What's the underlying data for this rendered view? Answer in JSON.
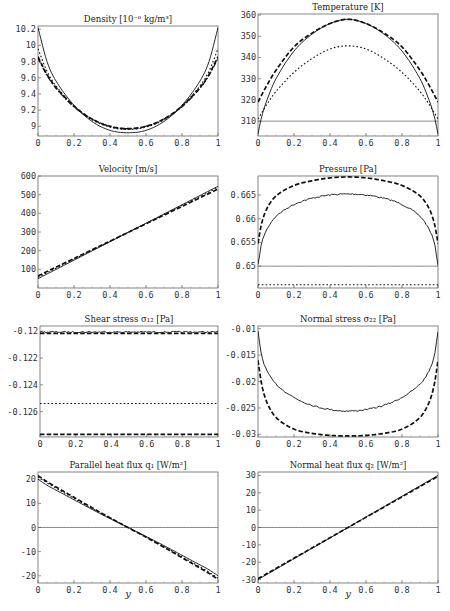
{
  "chart_data": [
    {
      "type": "line",
      "title": "Density [10⁻⁶ kg/m³]",
      "xlabel": "",
      "ylabel": "",
      "xlim": [
        0,
        1
      ],
      "ylim": [
        8.88,
        10.24
      ],
      "xticks": [
        "0",
        "0.2",
        "0.4",
        "0.6",
        "0.8",
        "1"
      ],
      "yticks": [
        {
          "v": 9,
          "label": "9"
        },
        {
          "v": 9.2,
          "label": "9.2"
        },
        {
          "v": 9.4,
          "label": "9.4"
        },
        {
          "v": 9.6,
          "label": "9.6"
        },
        {
          "v": 9.8,
          "label": "9.8"
        },
        {
          "v": 10,
          "label": "10"
        },
        {
          "v": 10.2,
          "label": "10.2"
        }
      ],
      "series": [
        {
          "name": "solid",
          "style": "solid",
          "x": [
            0,
            0.05,
            0.1,
            0.2,
            0.3,
            0.4,
            0.5,
            0.6,
            0.7,
            0.8,
            0.9,
            0.95,
            1
          ],
          "y": [
            10.22,
            9.8,
            9.56,
            9.26,
            9.06,
            8.95,
            8.92,
            8.95,
            9.06,
            9.26,
            9.56,
            9.8,
            10.22
          ]
        },
        {
          "name": "dotted",
          "style": "dotted",
          "x": [
            0,
            0.05,
            0.1,
            0.2,
            0.3,
            0.4,
            0.5,
            0.6,
            0.7,
            0.8,
            0.9,
            0.95,
            1
          ],
          "y": [
            9.96,
            9.68,
            9.5,
            9.25,
            9.08,
            8.99,
            8.96,
            8.99,
            9.08,
            9.25,
            9.5,
            9.68,
            9.96
          ]
        },
        {
          "name": "dashed",
          "style": "dashed",
          "x": [
            0,
            0.05,
            0.1,
            0.2,
            0.3,
            0.4,
            0.5,
            0.6,
            0.7,
            0.8,
            0.9,
            0.95,
            1
          ],
          "y": [
            9.86,
            9.64,
            9.48,
            9.25,
            9.09,
            9.0,
            8.97,
            9.0,
            9.09,
            9.25,
            9.48,
            9.64,
            9.86
          ]
        },
        {
          "name": "dash-dot",
          "style": "dashdot",
          "x": [
            0,
            0.05,
            0.1,
            0.2,
            0.3,
            0.4,
            0.5,
            0.6,
            0.7,
            0.8,
            0.9,
            0.95,
            1
          ],
          "y": [
            9.84,
            9.63,
            9.47,
            9.24,
            9.09,
            9.0,
            8.97,
            9.0,
            9.09,
            9.24,
            9.47,
            9.63,
            9.84
          ]
        }
      ]
    },
    {
      "type": "line",
      "title": "Temperature [K]",
      "xlabel": "",
      "ylabel": "",
      "xlim": [
        0,
        1
      ],
      "ylim": [
        303,
        360.5
      ],
      "xticks": [
        "0",
        "0.2",
        "0.4",
        "0.6",
        "0.8",
        "1"
      ],
      "yticks": [
        {
          "v": 310,
          "label": "310"
        },
        {
          "v": 320,
          "label": "320"
        },
        {
          "v": 330,
          "label": "330"
        },
        {
          "v": 340,
          "label": "340"
        },
        {
          "v": 350,
          "label": "350"
        },
        {
          "v": 360,
          "label": "360"
        }
      ],
      "series": [
        {
          "name": "wall-reference",
          "style": "thin",
          "x": [
            0,
            1
          ],
          "y": [
            310,
            310
          ]
        },
        {
          "name": "solid",
          "style": "solid",
          "x": [
            0,
            0.02,
            0.05,
            0.1,
            0.2,
            0.3,
            0.4,
            0.5,
            0.6,
            0.7,
            0.8,
            0.9,
            0.95,
            0.98,
            1
          ],
          "y": [
            304,
            312,
            320,
            330,
            343,
            351,
            356,
            358,
            356,
            351,
            343,
            330,
            320,
            312,
            304
          ]
        },
        {
          "name": "dotted",
          "style": "dotted",
          "x": [
            0,
            0.05,
            0.1,
            0.2,
            0.3,
            0.4,
            0.5,
            0.6,
            0.7,
            0.8,
            0.9,
            0.95,
            1
          ],
          "y": [
            311,
            318,
            324,
            333,
            339.5,
            344,
            345.5,
            344,
            339.5,
            333,
            324,
            318,
            311
          ]
        },
        {
          "name": "dashed",
          "style": "dashed",
          "x": [
            0,
            0.05,
            0.1,
            0.2,
            0.3,
            0.4,
            0.5,
            0.6,
            0.7,
            0.8,
            0.9,
            0.95,
            1
          ],
          "y": [
            319,
            327,
            334,
            345,
            351.5,
            356,
            358,
            356,
            351.5,
            345,
            334,
            327,
            319
          ]
        }
      ]
    },
    {
      "type": "line",
      "title": "Velocity [m/s]",
      "xlabel": "",
      "ylabel": "",
      "xlim": [
        0,
        1
      ],
      "ylim": [
        0,
        600
      ],
      "xticks": [
        "0",
        "0.2",
        "0.4",
        "0.6",
        "0.8",
        "1"
      ],
      "yticks": [
        {
          "v": 100,
          "label": "100"
        },
        {
          "v": 200,
          "label": "200"
        },
        {
          "v": 300,
          "label": "300"
        },
        {
          "v": 400,
          "label": "400"
        },
        {
          "v": 500,
          "label": "500"
        },
        {
          "v": 600,
          "label": "600"
        }
      ],
      "series": [
        {
          "name": "solid",
          "style": "solid",
          "x": [
            0,
            1
          ],
          "y": [
            50,
            545
          ]
        },
        {
          "name": "dashed",
          "style": "dashed",
          "x": [
            0,
            1
          ],
          "y": [
            65,
            530
          ]
        },
        {
          "name": "dotted",
          "style": "dotted",
          "x": [
            0,
            1
          ],
          "y": [
            58,
            538
          ]
        }
      ]
    },
    {
      "type": "line",
      "title": "Pressure [Pa]",
      "xlabel": "",
      "ylabel": "",
      "xlim": [
        0,
        1
      ],
      "ylim": [
        0.6454,
        0.669
      ],
      "xticks": [
        "0",
        "0.2",
        "0.4",
        "0.6",
        "0.8",
        "1"
      ],
      "yticks": [
        {
          "v": 0.65,
          "label": "0.65"
        },
        {
          "v": 0.655,
          "label": "0.655"
        },
        {
          "v": 0.66,
          "label": "0.66"
        },
        {
          "v": 0.665,
          "label": "0.665"
        }
      ],
      "series": [
        {
          "name": "reference",
          "style": "thin",
          "x": [
            0,
            1
          ],
          "y": [
            0.65,
            0.65
          ]
        },
        {
          "name": "solid",
          "style": "noisy",
          "x": [
            0,
            0.02,
            0.05,
            0.1,
            0.2,
            0.3,
            0.4,
            0.5,
            0.6,
            0.7,
            0.8,
            0.9,
            0.95,
            0.98,
            1
          ],
          "y": [
            0.6502,
            0.6548,
            0.6578,
            0.6605,
            0.663,
            0.6643,
            0.665,
            0.6652,
            0.665,
            0.6643,
            0.663,
            0.6605,
            0.6578,
            0.6548,
            0.6502
          ]
        },
        {
          "name": "dashed",
          "style": "dashed",
          "x": [
            0,
            0.02,
            0.05,
            0.1,
            0.2,
            0.3,
            0.4,
            0.5,
            0.6,
            0.7,
            0.8,
            0.9,
            0.95,
            0.98,
            1
          ],
          "y": [
            0.6548,
            0.659,
            0.6622,
            0.6648,
            0.667,
            0.668,
            0.6686,
            0.6688,
            0.6686,
            0.668,
            0.667,
            0.6648,
            0.6622,
            0.659,
            0.6548
          ]
        },
        {
          "name": "dotted",
          "style": "dotted",
          "x": [
            0,
            1
          ],
          "y": [
            0.6461,
            0.6461
          ]
        }
      ]
    },
    {
      "type": "line",
      "title": "Shear stress σ₁₂ [Pa]",
      "xlabel": "",
      "ylabel": "",
      "xlim": [
        0,
        1
      ],
      "ylim": [
        -0.1279,
        -0.1196
      ],
      "xticks": [
        "0",
        "0.2",
        "0.4",
        "0.6",
        "0.8",
        "1"
      ],
      "yticks": [
        {
          "v": -0.12,
          "label": "-0.12"
        },
        {
          "v": -0.122,
          "label": "-0.122"
        },
        {
          "v": -0.124,
          "label": "-0.124"
        },
        {
          "v": -0.126,
          "label": "-0.126"
        }
      ],
      "series": [
        {
          "name": "solid",
          "style": "noisy",
          "x": [
            0,
            1
          ],
          "y": [
            -0.12005,
            -0.12005
          ]
        },
        {
          "name": "dashdot",
          "style": "dashed",
          "x": [
            0,
            1
          ],
          "y": [
            -0.12015,
            -0.12015
          ]
        },
        {
          "name": "dotted",
          "style": "dotted",
          "x": [
            0,
            1
          ],
          "y": [
            -0.1254,
            -0.1254
          ]
        },
        {
          "name": "dashed",
          "style": "dashed",
          "x": [
            0,
            1
          ],
          "y": [
            -0.1277,
            -0.1277
          ]
        }
      ]
    },
    {
      "type": "line",
      "title": "Normal stress σ₂₂ [Pa]",
      "xlabel": "",
      "ylabel": "",
      "xlim": [
        0,
        1
      ],
      "ylim": [
        -0.0305,
        -0.0095
      ],
      "xticks": [
        "0",
        "0.2",
        "0.4",
        "0.6",
        "0.8",
        "1"
      ],
      "yticks": [
        {
          "v": -0.01,
          "label": "-0.01"
        },
        {
          "v": -0.015,
          "label": "-0.015"
        },
        {
          "v": -0.02,
          "label": "-0.02"
        },
        {
          "v": -0.025,
          "label": "-0.025"
        },
        {
          "v": -0.03,
          "label": "-0.03"
        }
      ],
      "series": [
        {
          "name": "solid",
          "style": "noisy",
          "x": [
            0,
            0.02,
            0.05,
            0.1,
            0.2,
            0.3,
            0.4,
            0.5,
            0.6,
            0.7,
            0.8,
            0.9,
            0.95,
            0.98,
            1
          ],
          "y": [
            -0.0105,
            -0.015,
            -0.018,
            -0.0205,
            -0.023,
            -0.0245,
            -0.0253,
            -0.0256,
            -0.0253,
            -0.0245,
            -0.023,
            -0.0205,
            -0.018,
            -0.015,
            -0.0105
          ]
        },
        {
          "name": "dashed",
          "style": "dashed",
          "x": [
            0,
            0.02,
            0.05,
            0.1,
            0.2,
            0.3,
            0.4,
            0.5,
            0.6,
            0.7,
            0.8,
            0.9,
            0.95,
            0.98,
            1
          ],
          "y": [
            -0.016,
            -0.0205,
            -0.024,
            -0.0268,
            -0.029,
            -0.0298,
            -0.0302,
            -0.0303,
            -0.0302,
            -0.0298,
            -0.029,
            -0.0268,
            -0.024,
            -0.0205,
            -0.016
          ]
        }
      ]
    },
    {
      "type": "line",
      "title": "Parallel heat flux q₁ [W/m²]",
      "xlabel": "y",
      "ylabel": "",
      "xlim": [
        0,
        1
      ],
      "ylim": [
        -23,
        23
      ],
      "xticks": [
        "0",
        "0.2",
        "0.4",
        "0.6",
        "0.8",
        "1"
      ],
      "yticks": [
        {
          "v": -20,
          "label": "-20"
        },
        {
          "v": -10,
          "label": "-10"
        },
        {
          "v": 0,
          "label": "0"
        },
        {
          "v": 10,
          "label": "10"
        },
        {
          "v": 20,
          "label": "20"
        }
      ],
      "series": [
        {
          "name": "zero-reference",
          "style": "thin",
          "x": [
            0,
            1
          ],
          "y": [
            0,
            0
          ]
        },
        {
          "name": "solid",
          "style": "solid",
          "x": [
            0,
            0.05,
            0.1,
            0.2,
            0.3,
            0.4,
            0.5,
            0.6,
            0.7,
            0.8,
            0.9,
            0.95,
            1
          ],
          "y": [
            20,
            17.5,
            15.5,
            11.5,
            7.5,
            3.7,
            0,
            -3.7,
            -7.5,
            -11.5,
            -15.5,
            -17.5,
            -20
          ]
        },
        {
          "name": "dashed",
          "style": "dashed",
          "x": [
            0,
            0.05,
            0.1,
            0.2,
            0.3,
            0.4,
            0.5,
            0.6,
            0.7,
            0.8,
            0.9,
            0.95,
            1
          ],
          "y": [
            21.5,
            19,
            16.8,
            12.5,
            8.2,
            4,
            0,
            -4,
            -8.2,
            -12.5,
            -16.8,
            -19,
            -21.5
          ]
        },
        {
          "name": "dotted",
          "style": "dotted",
          "x": [
            0,
            0.05,
            0.1,
            0.2,
            0.3,
            0.4,
            0.5,
            0.6,
            0.7,
            0.8,
            0.9,
            0.95,
            1
          ],
          "y": [
            21,
            18.5,
            16.3,
            12.1,
            7.9,
            3.9,
            0,
            -3.9,
            -7.9,
            -12.1,
            -16.3,
            -18.5,
            -21
          ]
        }
      ]
    },
    {
      "type": "line",
      "title": "Normal heat flux q₂ [W/m²]",
      "xlabel": "y",
      "ylabel": "",
      "xlim": [
        0,
        1
      ],
      "ylim": [
        -32,
        32
      ],
      "xticks": [
        "0",
        "0.2",
        "0.4",
        "0.6",
        "0.8",
        "1"
      ],
      "yticks": [
        {
          "v": -30,
          "label": "-30"
        },
        {
          "v": -20,
          "label": "-20"
        },
        {
          "v": -10,
          "label": "-10"
        },
        {
          "v": 0,
          "label": "0"
        },
        {
          "v": 10,
          "label": "10"
        },
        {
          "v": 20,
          "label": "20"
        },
        {
          "v": 30,
          "label": "30"
        }
      ],
      "series": [
        {
          "name": "zero-reference",
          "style": "thin",
          "x": [
            0,
            1
          ],
          "y": [
            0,
            0
          ]
        },
        {
          "name": "solid",
          "style": "solid",
          "x": [
            0,
            1
          ],
          "y": [
            -30,
            30
          ]
        },
        {
          "name": "dashed",
          "style": "dashed",
          "x": [
            0,
            1
          ],
          "y": [
            -29.5,
            29.5
          ]
        }
      ]
    }
  ]
}
